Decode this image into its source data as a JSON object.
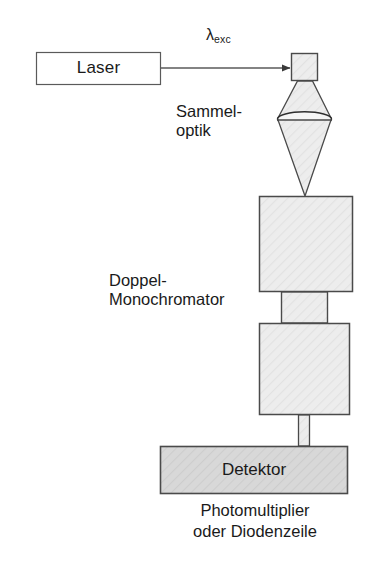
{
  "figure": {
    "background_color": "#ffffff",
    "stroke_color": "#4a4a4a",
    "box_fill": "#ededed",
    "detector_fill": "#d8d8d8",
    "text_color": "#1a1a1a"
  },
  "labels": {
    "laser": "Laser",
    "lambda_symbol": "λ",
    "lambda_subscript": "exc",
    "sammeloptik_line1": "Sammel-",
    "sammeloptik_line2": "optik",
    "doppelmono_line1": "Doppel-",
    "doppelmono_line2": "Monochromator",
    "detektor": "Detektor",
    "caption_line1": "Photomultiplier",
    "caption_line2": "oder Diodenzeile"
  },
  "components": [
    {
      "name": "laser-box",
      "shape": "rectangle",
      "x": 36,
      "y": 52,
      "width": 125,
      "height": 33,
      "fill": "#ffffff"
    },
    {
      "name": "excitation-arrow",
      "shape": "arrow",
      "from_x": 161,
      "from_y": 68,
      "to_x": 291,
      "to_y": 68
    },
    {
      "name": "sample-square",
      "shape": "rectangle",
      "x": 291,
      "y": 53,
      "width": 27,
      "height": 28,
      "fill": "#ededed"
    },
    {
      "name": "upper-light-cone",
      "shape": "trapezoid",
      "top_x1": 297,
      "top_x2": 312,
      "top_y": 81,
      "bottom_x1": 278,
      "bottom_x2": 331,
      "bottom_y": 118,
      "fill": "#ededed"
    },
    {
      "name": "collection-lens",
      "shape": "ellipse",
      "cx": 304.5,
      "cy": 119,
      "rx": 27,
      "ry": 7,
      "fill": "#f4f4f4"
    },
    {
      "name": "lower-light-cone",
      "shape": "triangle",
      "top_x1": 278,
      "top_x2": 331,
      "top_y": 120,
      "apex_x": 305,
      "apex_y": 196,
      "fill": "#ededed"
    },
    {
      "name": "monochromator-stage-1",
      "shape": "rectangle",
      "x": 259,
      "y": 196,
      "width": 94,
      "height": 96,
      "fill": "#ededed"
    },
    {
      "name": "monochromator-connector",
      "shape": "rectangle",
      "x": 281,
      "y": 292,
      "width": 47,
      "height": 31,
      "fill": "#ededed"
    },
    {
      "name": "monochromator-stage-2",
      "shape": "rectangle",
      "x": 259,
      "y": 323,
      "width": 91,
      "height": 92,
      "fill": "#ededed"
    },
    {
      "name": "detector-connector",
      "shape": "rectangle",
      "x": 298,
      "y": 415,
      "width": 12,
      "height": 31,
      "fill": "#ededed"
    },
    {
      "name": "detector-box",
      "shape": "rectangle",
      "x": 160,
      "y": 446,
      "width": 188,
      "height": 48,
      "fill": "#d8d8d8"
    }
  ]
}
